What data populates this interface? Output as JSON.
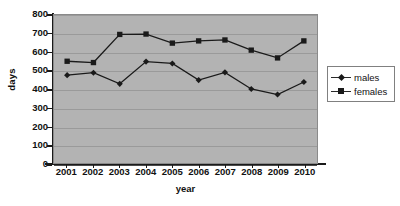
{
  "chart_data": {
    "type": "line",
    "title": "",
    "xlabel": "year",
    "ylabel": "days",
    "categories": [
      "2001",
      "2002",
      "2003",
      "2004",
      "2005",
      "2006",
      "2007",
      "2008",
      "2009",
      "2010"
    ],
    "x": [
      2001,
      2002,
      2003,
      2004,
      2005,
      2006,
      2007,
      2008,
      2009,
      2010
    ],
    "series": [
      {
        "name": "males",
        "marker": "diamond",
        "color": "#1a1a1a",
        "values": [
          475,
          488,
          428,
          548,
          538,
          448,
          490,
          400,
          370,
          438
        ]
      },
      {
        "name": "females",
        "marker": "square",
        "color": "#1a1a1a",
        "values": [
          550,
          543,
          695,
          697,
          648,
          660,
          665,
          610,
          568,
          660
        ]
      }
    ],
    "ylim": [
      0,
      800
    ],
    "yticks": [
      0,
      100,
      200,
      300,
      400,
      500,
      600,
      700,
      800
    ],
    "ytick_labels": [
      "0",
      "100",
      "200",
      "300",
      "400",
      "500",
      "600",
      "700",
      "800"
    ],
    "grid": true,
    "grid_axis": "y",
    "legend_position": "right",
    "plot_background": "#b3b3b3",
    "figure_background": "#ffffff",
    "grid_color": "#9a9a9a"
  },
  "legend": {
    "entries": [
      {
        "label": "males",
        "marker": "diamond"
      },
      {
        "label": "females",
        "marker": "square"
      }
    ]
  },
  "axes": {
    "y_title": "days",
    "x_title": "year"
  }
}
